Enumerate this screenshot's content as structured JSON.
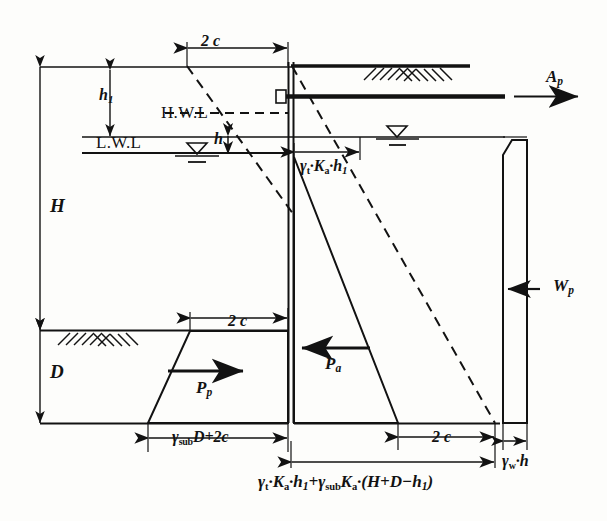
{
  "figure": {
    "kind": "engineering-diagram",
    "dimensions": {
      "top_2c": "2 c",
      "mid_left_2c": "2 c",
      "bottom_right_2c": "2 c",
      "h1": "h",
      "h1_sub": "1",
      "h": "h",
      "H": "H",
      "D": "D"
    },
    "water_levels": {
      "high": "H.W.L",
      "low": "L.W.L"
    },
    "forces": {
      "anchor": "A",
      "anchor_sub": "p",
      "active": "P",
      "active_sub": "a",
      "passive": "P",
      "passive_sub": "p",
      "water": "W",
      "water_sub": "p"
    },
    "pressure_labels": {
      "active_top": {
        "gamma": "γ",
        "gamma_sub": "t",
        "mid": "·K",
        "k_sub": "a",
        "tail": "·h",
        "tail_sub": "1",
        "full": "γt·Ka·h1"
      },
      "passive_left_bottom": {
        "full": "γsubD+2c",
        "gamma": "γ",
        "gamma_sub": "sub",
        "rest": "D+2c"
      },
      "water_pressure": {
        "gamma": "γ",
        "gamma_sub": "w",
        "rest": "·h",
        "full": "γw·h"
      },
      "base_formula": {
        "full": "γt·Ka·h1+γsubKa·(H+D−h1)",
        "p1_gamma": "γ",
        "p1_gamma_sub": "t",
        "p1_mid": "·K",
        "p1_k_sub": "a",
        "p1_tail": "·h",
        "p1_tail_sub": "1",
        "plus": "+",
        "p2_gamma": "γ",
        "p2_gamma_sub": "sub",
        "p2_k": "K",
        "p2_k_sub": "a",
        "p2_rest": "·(H+D−h",
        "p2_rest_sub": "1",
        "p2_close": ")"
      }
    },
    "colors": {
      "ink": "#121212",
      "paper": "#fdfdfb"
    }
  }
}
